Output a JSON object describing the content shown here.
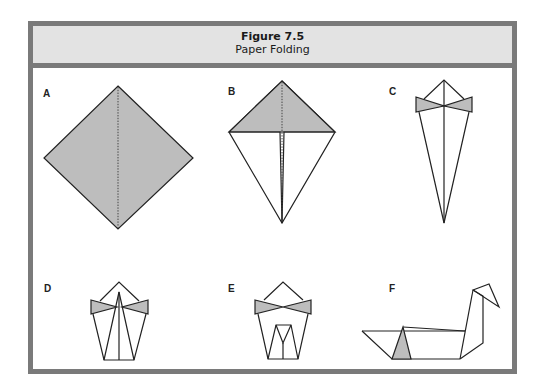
{
  "figure": {
    "number": "Figure 7.5",
    "title": "Paper Folding"
  },
  "panels": [
    {
      "label": "A",
      "description": "Square sheet turned as a diamond, shaded, with dotted center fold line"
    },
    {
      "label": "B",
      "description": "Sides folded to center forming a kite; top triangle shaded"
    },
    {
      "label": "C",
      "description": "Narrow kite with shaded bow-tie folds near the top"
    },
    {
      "label": "D",
      "description": "Folded up into pentagon shape with shaded bow-tie"
    },
    {
      "label": "E",
      "description": "Pentagon with inner folds and shaded bow-tie"
    },
    {
      "label": "F",
      "description": "Finished paper swan with shaded triangle on hull"
    }
  ],
  "colors": {
    "frame": "#7a7a7a",
    "header_bg": "#e3e3e3",
    "shade": "#bdbdbd",
    "line": "#222222"
  }
}
